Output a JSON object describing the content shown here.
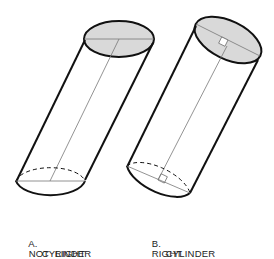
{
  "figure": {
    "colors": {
      "stroke": "#111111",
      "axis": "#777777",
      "cap_fill": "#d9d9d9",
      "background": "#ffffff"
    },
    "cylinders": [
      {
        "id": "A",
        "label_letter": "A.",
        "label_line1": "NOT  RIGHT",
        "label_line2": "CYLINDER",
        "has_right_angle_marks": false
      },
      {
        "id": "B",
        "label_letter": "B.",
        "label_line1": "RIGHT",
        "label_line2": "CYLINDER",
        "has_right_angle_marks": true
      }
    ]
  }
}
